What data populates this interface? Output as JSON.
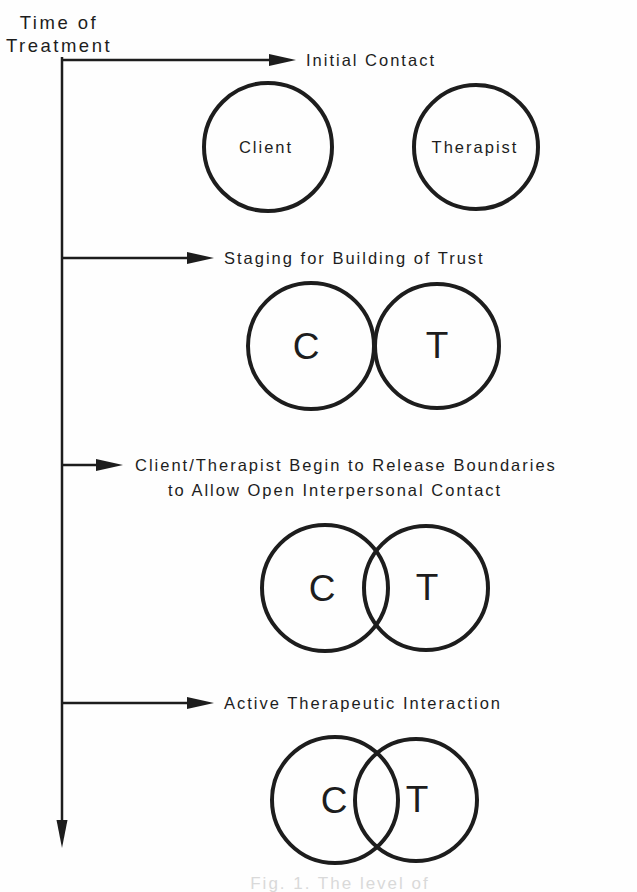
{
  "figure": {
    "timeline_label": {
      "line1": "Time of",
      "line2": "Treatment"
    },
    "stages": [
      {
        "title": "Initial Contact",
        "left_label": "Client",
        "right_label": "Therapist",
        "circle_relation": "separate"
      },
      {
        "title": "Staging for Building of Trust",
        "left_label": "C",
        "right_label": "T",
        "circle_relation": "touching"
      },
      {
        "title": "Client/Therapist Begin to Release Boundaries",
        "title_line2": "to Allow Open Interpersonal Contact",
        "left_label": "C",
        "right_label": "T",
        "circle_relation": "small-overlap"
      },
      {
        "title": "Active Therapeutic Interaction",
        "left_label": "C",
        "right_label": "T",
        "circle_relation": "large-overlap"
      }
    ],
    "caption_partial": "Fig. 1. The level of",
    "colors": {
      "ink": "#1d1d1d",
      "background": "#fefefe",
      "caption_faint": "#d9d9d9"
    }
  }
}
